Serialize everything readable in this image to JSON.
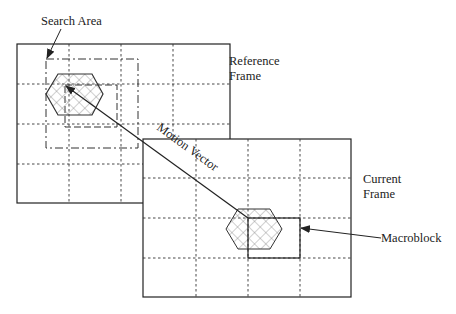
{
  "diagram": {
    "type": "block-matching motion estimation",
    "labels": {
      "search_area": "Search Area",
      "reference_frame_line1": "Reference",
      "reference_frame_line2": "Frame",
      "current_frame_line1": "Current",
      "current_frame_line2": "Frame",
      "macroblock": "Macroblock",
      "motion_vector": "Motion Vector"
    },
    "reference_frame": {
      "x": 17,
      "y": 44,
      "w": 213,
      "h": 159,
      "cols": 4,
      "rows": 4
    },
    "current_frame": {
      "x": 143,
      "y": 139,
      "w": 208,
      "h": 158,
      "cols": 4,
      "rows": 4
    },
    "colors": {
      "stroke": "#222222",
      "hatch": "#888888",
      "background": "#ffffff"
    }
  }
}
